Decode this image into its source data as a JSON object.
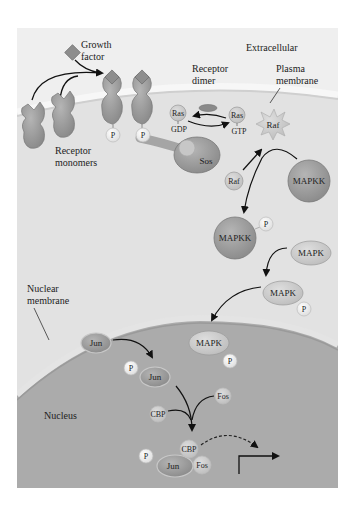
{
  "figure": {
    "colors": {
      "background": "#ffffff",
      "cytoplasm": "#e6e6e6",
      "nucleus": "#a9a9a9",
      "membrane": "#d8d8d8",
      "molecule_fill": "#9a9a9a",
      "phosphate_fill": "#f2f2f2",
      "arrow": "#111111"
    }
  },
  "labels": {
    "growth_factor": [
      "Growth",
      "factor"
    ],
    "extracellular": "Extracellular",
    "receptor_dimer": [
      "Receptor",
      "dimer"
    ],
    "plasma_membrane": [
      "Plasma",
      "membrane"
    ],
    "receptor_monomers": [
      "Receptor",
      "monomers"
    ],
    "nuclear_membrane": [
      "Nuclear",
      "membrane"
    ],
    "nucleus": "Nucleus"
  },
  "molecules": {
    "p": "P",
    "ras": "Ras",
    "gdp": "GDP",
    "gtp": "GTP",
    "raf": "Raf",
    "sos": "Sos",
    "mapkk": "MAPKK",
    "mapk": "MAPK",
    "jun": "Jun",
    "fos": "Fos",
    "cbp": "CBP"
  }
}
